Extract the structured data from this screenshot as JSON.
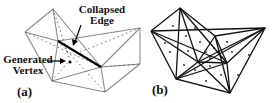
{
  "figure": {
    "panels": [
      {
        "id": "a",
        "label": "(a)"
      },
      {
        "id": "b",
        "label": "(b)"
      }
    ],
    "annotations": {
      "collapsed_edge": [
        "Collapsed",
        "Edge"
      ],
      "generated_vertex": [
        "Generated",
        "Vertex"
      ]
    },
    "colors": {
      "mesh_a": "#888888",
      "mesh_b": "#111111",
      "highlight_edge": "#000000"
    }
  }
}
